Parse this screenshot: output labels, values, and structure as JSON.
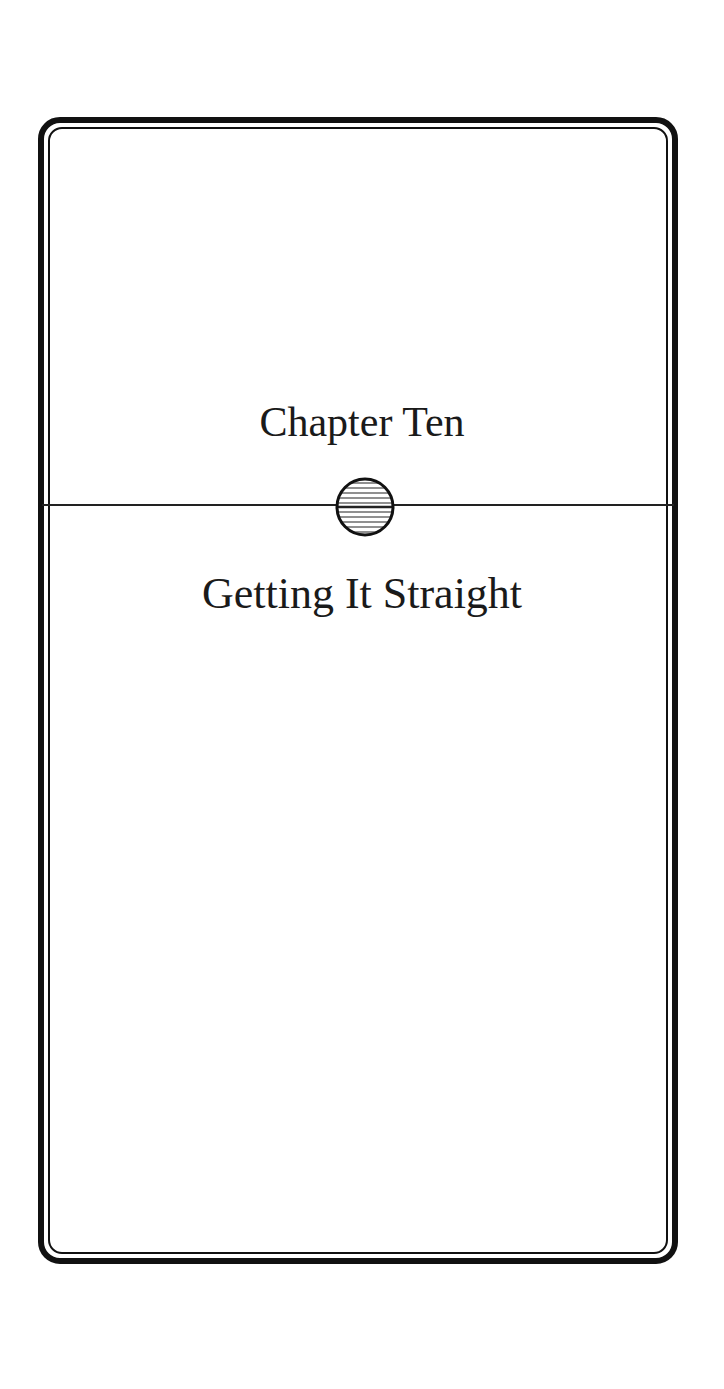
{
  "page": {
    "chapter_label": "Chapter Ten",
    "chapter_title": "Getting It Straight",
    "ornament": "hatched-circle-icon",
    "colors": {
      "ink": "#111111",
      "paper": "#ffffff"
    }
  }
}
